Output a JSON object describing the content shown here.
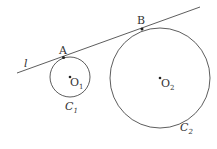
{
  "line": {
    "label": "l",
    "x1": 17,
    "y1": 73,
    "x2": 200,
    "y2": 7
  },
  "circles": [
    {
      "name": "C",
      "sub": "1",
      "center_label": "O",
      "center_sub": "1",
      "cx": 70,
      "cy": 77,
      "r": 20
    },
    {
      "name": "C",
      "sub": "2",
      "center_label": "O",
      "center_sub": "2",
      "cx": 160,
      "cy": 78,
      "r": 50
    }
  ],
  "points": [
    {
      "label": "A",
      "x": 63.5,
      "y": 57.5
    },
    {
      "label": "B",
      "x": 142,
      "y": 29
    }
  ],
  "colors": {
    "stroke": "#333333"
  }
}
